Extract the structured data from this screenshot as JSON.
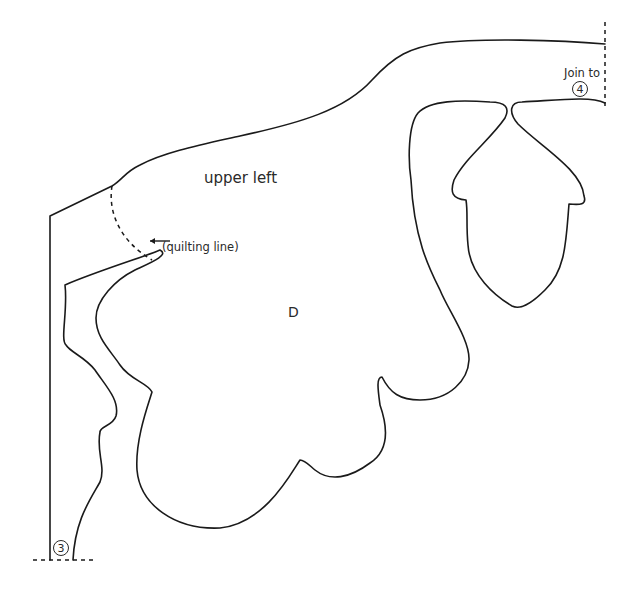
{
  "diagram": {
    "type": "quilt-applique-pattern",
    "piece_label": "D",
    "region_label": "upper left",
    "annotation": {
      "text": "(quilting line)",
      "arrow_icon": "left-arrow-icon"
    },
    "join_top_right": {
      "text": "Join to",
      "badge": "4"
    },
    "join_bottom_left": {
      "badge": "3"
    },
    "colors": {
      "stroke": "#1a1a1a",
      "background": "#ffffff"
    }
  }
}
